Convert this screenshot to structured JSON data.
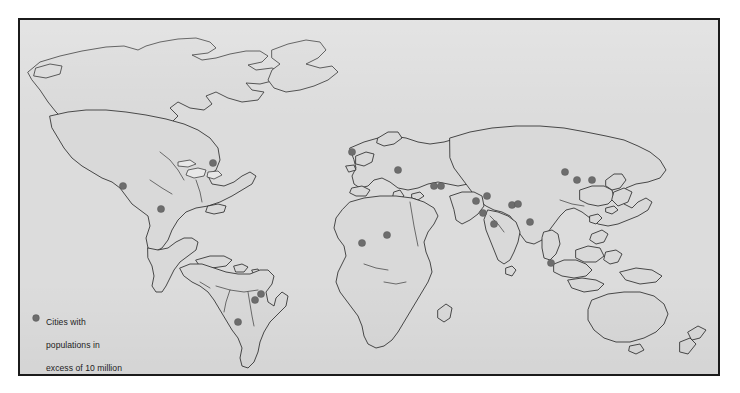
{
  "figure": {
    "kind": "world-map",
    "frame_color": "#1b1b1b",
    "ocean_color": "#dcdcdc",
    "land_color": "#d9d9d9",
    "coastline_color": "#2d2d2d",
    "dot_color": "#6d6d6d"
  },
  "legend": {
    "marker": "filled-circle",
    "lines": [
      "Cities with",
      "populations in",
      "excess of 10 million",
      "by 2000 A.D."
    ],
    "full_text": "Cities with populations in excess of 10 million by 2000 A.D."
  },
  "chart_data": {
    "type": "map",
    "title": "",
    "projection": "equirectangular-style world outline",
    "series_name": "Cities with populations in excess of 10 million by 2000 A.D.",
    "marker": "filled-circle",
    "marker_color": "#6d6d6d",
    "marker_radius_px": 3.6,
    "point_count": 23,
    "points": [
      {
        "name": "Los Angeles",
        "x": 123,
        "y": 186
      },
      {
        "name": "Mexico City",
        "x": 161,
        "y": 209
      },
      {
        "name": "New York",
        "x": 213,
        "y": 163
      },
      {
        "name": "Rio de Janeiro",
        "x": 261,
        "y": 294
      },
      {
        "name": "Sao Paulo",
        "x": 255,
        "y": 300
      },
      {
        "name": "Buenos Aires",
        "x": 238,
        "y": 322
      },
      {
        "name": "London",
        "x": 352,
        "y": 152
      },
      {
        "name": "Istanbul",
        "x": 398,
        "y": 170
      },
      {
        "name": "Cairo",
        "x": 387,
        "y": 235
      },
      {
        "name": "Lagos",
        "x": 362,
        "y": 243
      },
      {
        "name": "Baghdad",
        "x": 434,
        "y": 186
      },
      {
        "name": "Tehran",
        "x": 441,
        "y": 186
      },
      {
        "name": "Karachi",
        "x": 476,
        "y": 201
      },
      {
        "name": "Delhi",
        "x": 487,
        "y": 196
      },
      {
        "name": "Mumbai",
        "x": 483,
        "y": 213
      },
      {
        "name": "Chennai",
        "x": 494,
        "y": 224
      },
      {
        "name": "Kolkata",
        "x": 512,
        "y": 205
      },
      {
        "name": "Dhaka",
        "x": 518,
        "y": 204
      },
      {
        "name": "Bangkok",
        "x": 530,
        "y": 222
      },
      {
        "name": "Jakarta",
        "x": 551,
        "y": 263
      },
      {
        "name": "Beijing",
        "x": 565,
        "y": 172
      },
      {
        "name": "Seoul",
        "x": 577,
        "y": 180
      },
      {
        "name": "Tokyo",
        "x": 592,
        "y": 180
      }
    ]
  }
}
